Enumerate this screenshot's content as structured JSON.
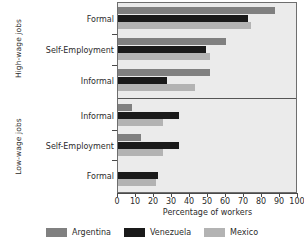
{
  "chart_data": {
    "type": "bar",
    "orientation": "horizontal",
    "title": "",
    "xlabel": "Percentage of workers",
    "ylabel": "",
    "xlim": [
      0,
      100
    ],
    "xticks": [
      0,
      10,
      20,
      30,
      40,
      50,
      60,
      70,
      80,
      90,
      100
    ],
    "grid": false,
    "legend_position": "bottom",
    "panels": [
      {
        "name": "High-wage jobs",
        "categories": [
          "Formal",
          "Self-Employment",
          "Informal"
        ]
      },
      {
        "name": "Low-wage jobs",
        "categories": [
          "Informal",
          "Self-Employment",
          "Formal"
        ]
      }
    ],
    "categories": [
      "Formal",
      "Self-Employment",
      "Informal",
      "Informal",
      "Self-Employment",
      "Formal"
    ],
    "series": [
      {
        "name": "Argentina",
        "color": "#808080",
        "values": [
          87,
          60,
          51,
          8,
          13,
          0
        ]
      },
      {
        "name": "Venezuela",
        "color": "#1a1a1a",
        "values": [
          72,
          49,
          27,
          34,
          34,
          22
        ]
      },
      {
        "name": "Mexico",
        "color": "#b3b3b3",
        "values": [
          74,
          51,
          43,
          25,
          25,
          21
        ]
      }
    ]
  },
  "axis": {
    "group_labels": [
      "High-wage jobs",
      "Low-wage jobs"
    ],
    "x_title": "Percentage of workers",
    "x_ticks": [
      "0",
      "10",
      "20",
      "30",
      "40",
      "50",
      "60",
      "70",
      "80",
      "90",
      "100"
    ],
    "category_labels": [
      "Formal",
      "Self-Employment",
      "Informal",
      "Informal",
      "Self-Employment",
      "Formal"
    ]
  },
  "legend": {
    "items": [
      {
        "label": "Argentina",
        "color": "#808080"
      },
      {
        "label": "Venezuela",
        "color": "#1a1a1a"
      },
      {
        "label": "Mexico",
        "color": "#b3b3b3"
      }
    ]
  }
}
